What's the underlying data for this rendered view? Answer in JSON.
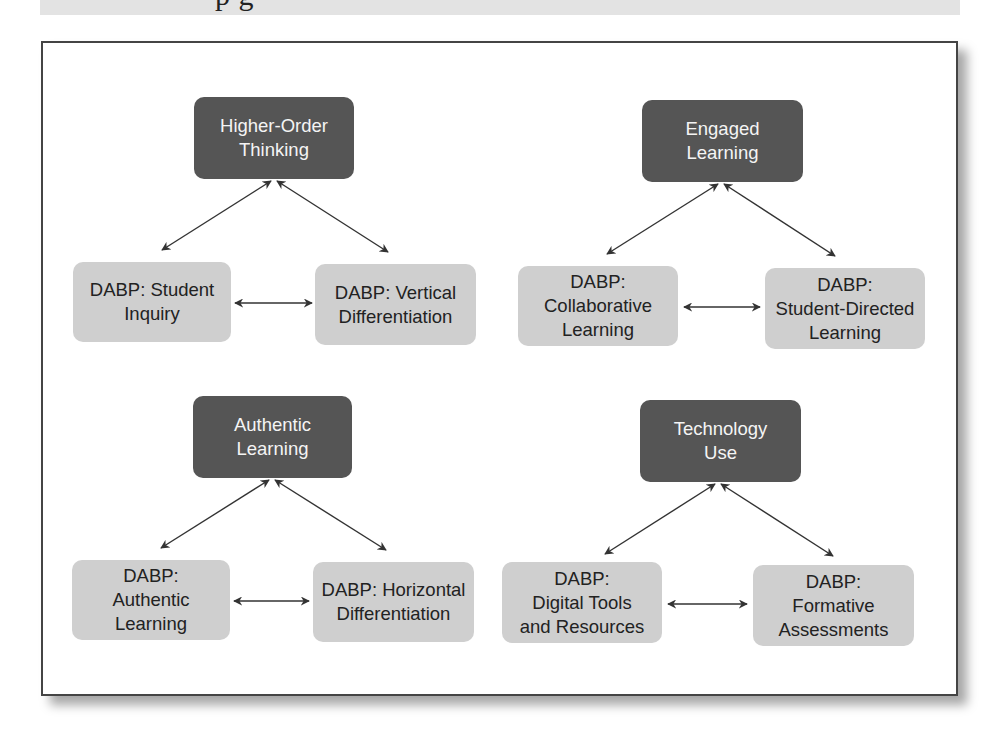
{
  "header": {
    "clipped_heading_text": "p    g"
  },
  "colors": {
    "core_box": "#555555",
    "dabp_box": "#cfcfcf",
    "arrow": "#333333",
    "frame_border": "#444444"
  },
  "clusters": [
    {
      "core": {
        "label": "Higher-Order\nThinking"
      },
      "left": {
        "label": "DABP: Student\nInquiry"
      },
      "right": {
        "label": "DABP: Vertical\nDifferentiation"
      }
    },
    {
      "core": {
        "label": "Engaged\nLearning"
      },
      "left": {
        "label": "DABP:\nCollaborative\nLearning"
      },
      "right": {
        "label": "DABP:\nStudent-Directed\nLearning"
      }
    },
    {
      "core": {
        "label": "Authentic\nLearning"
      },
      "left": {
        "label": "DABP:\nAuthentic\nLearning"
      },
      "right": {
        "label": "DABP: Horizontal\nDifferentiation"
      }
    },
    {
      "core": {
        "label": "Technology\nUse"
      },
      "left": {
        "label": "DABP:\nDigital Tools\nand Resources"
      },
      "right": {
        "label": "DABP:\nFormative\nAssessments"
      }
    }
  ],
  "connections": [
    {
      "from": "Higher-Order Thinking",
      "to": "DABP: Student Inquiry",
      "bidirectional": true
    },
    {
      "from": "Higher-Order Thinking",
      "to": "DABP: Vertical Differentiation",
      "bidirectional": true
    },
    {
      "from": "DABP: Student Inquiry",
      "to": "DABP: Vertical Differentiation",
      "bidirectional": true
    },
    {
      "from": "Engaged Learning",
      "to": "DABP: Collaborative Learning",
      "bidirectional": true
    },
    {
      "from": "Engaged Learning",
      "to": "DABP: Student-Directed Learning",
      "bidirectional": true
    },
    {
      "from": "DABP: Collaborative Learning",
      "to": "DABP: Student-Directed Learning",
      "bidirectional": true
    },
    {
      "from": "Authentic Learning",
      "to": "DABP: Authentic Learning",
      "bidirectional": true
    },
    {
      "from": "Authentic Learning",
      "to": "DABP: Horizontal Differentiation",
      "bidirectional": true
    },
    {
      "from": "DABP: Authentic Learning",
      "to": "DABP: Horizontal Differentiation",
      "bidirectional": true
    },
    {
      "from": "Technology Use",
      "to": "DABP: Digital Tools and Resources",
      "bidirectional": true
    },
    {
      "from": "Technology Use",
      "to": "DABP: Formative Assessments",
      "bidirectional": true
    },
    {
      "from": "DABP: Digital Tools and Resources",
      "to": "DABP: Formative Assessments",
      "bidirectional": true
    }
  ]
}
